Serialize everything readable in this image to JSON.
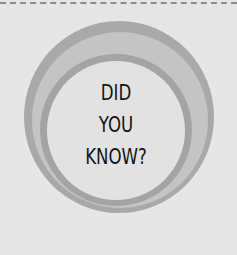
{
  "graphic": {
    "headline_lines": [
      "DID",
      "YOU",
      "KNOW?"
    ],
    "colors": {
      "background": "#e6e6e6",
      "outer_ring": "#a9a9a9",
      "middle_band": "#c4c4c4",
      "inner_ring": "#a4a4a4",
      "core": "#e2e2e2",
      "text": "#141414",
      "dash_line": "#8c8c8c"
    }
  }
}
